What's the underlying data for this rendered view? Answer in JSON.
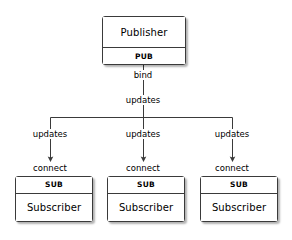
{
  "diagram": {
    "type": "flow-diagram",
    "background_color": "#ffffff",
    "line_color": "#3a3a3a",
    "text_color": "#000000"
  },
  "nodes": {
    "publisher": {
      "title": "Publisher",
      "socket": "PUB"
    },
    "subscribers": [
      {
        "title": "Subscriber",
        "socket": "SUB"
      },
      {
        "title": "Subscriber",
        "socket": "SUB"
      },
      {
        "title": "Subscriber",
        "socket": "SUB"
      }
    ]
  },
  "edge_labels": {
    "bind": "bind",
    "updates_trunk": "updates",
    "updates_branch_1": "updates",
    "updates_branch_2": "updates",
    "updates_branch_3": "updates",
    "connect_1": "connect",
    "connect_2": "connect",
    "connect_3": "connect"
  }
}
